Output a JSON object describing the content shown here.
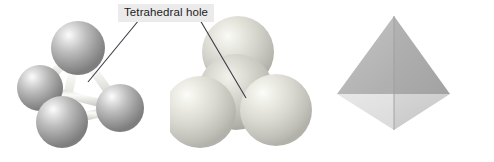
{
  "figure": {
    "title": "Tetrahedral hole",
    "background_color": "#ffffff",
    "width": 494,
    "height": 162
  },
  "annotation": {
    "label": "Tetrahedral hole",
    "label_box_color": "#ebebeb",
    "label_text_color": "#1c1c1c",
    "leader_line_color": "#3a3a45",
    "leader_lines": [
      {
        "name": "leader-to-ball-stick",
        "x1": 139,
        "y1": 20,
        "x2": 88,
        "y2": 82
      },
      {
        "name": "leader-to-space-filling",
        "x1": 200,
        "y1": 20,
        "x2": 246,
        "y2": 98
      }
    ]
  },
  "panels": [
    {
      "id": "ball-stick",
      "name": "ball-and-stick-tetrahedron",
      "description": "Four spheres joined by cylindrical bonds outlining a tetrahedron with a central hole",
      "sphere_count": 4,
      "bond_count": 6,
      "sphere_color": "#a8a8a8",
      "sphere_highlight_color": "#f2f2f2",
      "bond_color": "#f0f0ee",
      "spheres": [
        {
          "name": "sphere-top",
          "cx": 78,
          "cy": 48,
          "r": 27
        },
        {
          "name": "sphere-left",
          "cx": 40,
          "cy": 88,
          "r": 23
        },
        {
          "name": "sphere-bottom",
          "cx": 62,
          "cy": 122,
          "r": 26
        },
        {
          "name": "sphere-right",
          "cx": 120,
          "cy": 108,
          "r": 24
        }
      ]
    },
    {
      "id": "space-filling",
      "name": "space-filling-tetrahedron",
      "description": "Four close-packed spheres in contact; three in front, one behind at top",
      "sphere_count": 4,
      "sphere_color": "#cfcfc8",
      "sphere_highlight_color": "#f6f6f2",
      "spheres": [
        {
          "name": "sphere-back-top",
          "cx": 68,
          "cy": 52,
          "r": 36
        },
        {
          "name": "sphere-center",
          "cx": 66,
          "cy": 92,
          "r": 38
        },
        {
          "name": "sphere-front-left",
          "cx": 30,
          "cy": 112,
          "r": 36
        },
        {
          "name": "sphere-front-right",
          "cx": 106,
          "cy": 110,
          "r": 36
        }
      ]
    },
    {
      "id": "tetrahedron",
      "name": "solid-tetrahedron",
      "description": "Solid shaded tetrahedron showing four triangular faces",
      "face_count": 4,
      "vertices": {
        "apex": {
          "x": 74,
          "y": 16
        },
        "left": {
          "x": 17,
          "y": 94
        },
        "right": {
          "x": 130,
          "y": 94
        },
        "bottom": {
          "x": 73,
          "y": 130
        }
      },
      "face_colors": {
        "upper_left": "#b9b9b9",
        "upper_right": "#a9a9a9",
        "lower_left": "#e3e3e3",
        "lower_right": "#cdcdcd"
      },
      "edge_color": "#9c9c9c"
    }
  ]
}
